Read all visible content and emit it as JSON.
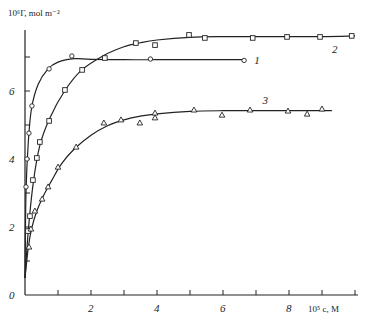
{
  "chart_data": {
    "type": "scatter",
    "title": "",
    "xlabel": "10^5 c, M",
    "ylabel": "10^6 Γ, mol m^-2",
    "xlim": [
      0,
      10.2
    ],
    "ylim": [
      0,
      8.0
    ],
    "x_ticks": [
      1,
      2,
      3,
      4,
      5,
      6,
      7,
      8,
      9,
      10
    ],
    "x_tick_labels": [
      {
        "value": 2,
        "label": "2"
      },
      {
        "value": 4,
        "label": "4"
      },
      {
        "value": 6,
        "label": "6"
      },
      {
        "value": 8,
        "label": "8"
      }
    ],
    "y_ticks": [
      1,
      2,
      3,
      4,
      5,
      6,
      7
    ],
    "y_tick_labels": [
      {
        "value": 0,
        "label": "0"
      },
      {
        "value": 2,
        "label": "2"
      },
      {
        "value": 4,
        "label": "4"
      },
      {
        "value": 6,
        "label": "6"
      }
    ],
    "grid": false,
    "legend": "inline curve labels",
    "series": [
      {
        "name": "1",
        "marker": "circle",
        "points": [
          [
            0.03,
            3.18
          ],
          [
            0.06,
            4.0
          ],
          [
            0.12,
            4.76
          ],
          [
            0.21,
            5.56
          ],
          [
            0.73,
            6.65
          ],
          [
            1.42,
            7.03
          ],
          [
            3.8,
            6.94
          ],
          [
            6.64,
            6.9
          ]
        ],
        "curve": [
          [
            0,
            0.5
          ],
          [
            0.03,
            3.0
          ],
          [
            0.1,
            4.5
          ],
          [
            0.2,
            5.5
          ],
          [
            0.4,
            6.2
          ],
          [
            0.7,
            6.65
          ],
          [
            1.0,
            6.85
          ],
          [
            1.5,
            6.95
          ],
          [
            2.0,
            6.93
          ],
          [
            3.0,
            6.92
          ],
          [
            4.0,
            6.92
          ],
          [
            5.0,
            6.92
          ],
          [
            6.0,
            6.92
          ],
          [
            6.6,
            6.92
          ]
        ],
        "label_pos": [
          6.95,
          6.9
        ]
      },
      {
        "name": "2",
        "marker": "square",
        "points": [
          [
            0.09,
            1.88
          ],
          [
            0.15,
            2.32
          ],
          [
            0.24,
            3.38
          ],
          [
            0.36,
            4.03
          ],
          [
            0.45,
            4.5
          ],
          [
            0.73,
            5.12
          ],
          [
            1.21,
            6.03
          ],
          [
            1.73,
            6.62
          ],
          [
            2.42,
            6.97
          ],
          [
            3.36,
            7.41
          ],
          [
            3.94,
            7.35
          ],
          [
            4.97,
            7.65
          ],
          [
            5.45,
            7.56
          ],
          [
            6.9,
            7.56
          ],
          [
            7.94,
            7.59
          ],
          [
            8.94,
            7.59
          ],
          [
            9.9,
            7.62
          ]
        ],
        "curve": [
          [
            0,
            0.5
          ],
          [
            0.1,
            1.9
          ],
          [
            0.25,
            3.3
          ],
          [
            0.45,
            4.4
          ],
          [
            0.75,
            5.2
          ],
          [
            1.2,
            6.0
          ],
          [
            1.7,
            6.6
          ],
          [
            2.4,
            7.05
          ],
          [
            3.0,
            7.3
          ],
          [
            3.5,
            7.42
          ],
          [
            4.0,
            7.5
          ],
          [
            5.0,
            7.58
          ],
          [
            6.0,
            7.6
          ],
          [
            7.0,
            7.6
          ],
          [
            8.0,
            7.6
          ],
          [
            9.0,
            7.6
          ],
          [
            10.0,
            7.62
          ]
        ],
        "label_pos": [
          9.3,
          7.25
        ]
      },
      {
        "name": "3",
        "marker": "triangle",
        "points": [
          [
            0.12,
            1.41
          ],
          [
            0.18,
            1.94
          ],
          [
            0.3,
            2.47
          ],
          [
            0.52,
            2.82
          ],
          [
            0.7,
            3.18
          ],
          [
            1.0,
            3.76
          ],
          [
            1.55,
            4.35
          ],
          [
            2.39,
            5.06
          ],
          [
            2.91,
            5.15
          ],
          [
            3.48,
            5.06
          ],
          [
            3.94,
            5.21
          ],
          [
            3.94,
            5.35
          ],
          [
            5.12,
            5.44
          ],
          [
            5.97,
            5.29
          ],
          [
            6.82,
            5.44
          ],
          [
            7.97,
            5.41
          ],
          [
            8.55,
            5.32
          ],
          [
            9.0,
            5.47
          ]
        ],
        "curve": [
          [
            0,
            0.5
          ],
          [
            0.1,
            1.4
          ],
          [
            0.2,
            1.95
          ],
          [
            0.35,
            2.45
          ],
          [
            0.55,
            2.9
          ],
          [
            0.8,
            3.35
          ],
          [
            1.1,
            3.85
          ],
          [
            1.5,
            4.3
          ],
          [
            2.0,
            4.7
          ],
          [
            2.5,
            4.98
          ],
          [
            3.0,
            5.15
          ],
          [
            3.5,
            5.26
          ],
          [
            4.0,
            5.33
          ],
          [
            5.0,
            5.4
          ],
          [
            6.0,
            5.42
          ],
          [
            7.0,
            5.42
          ],
          [
            8.0,
            5.42
          ],
          [
            9.0,
            5.42
          ],
          [
            9.3,
            5.42
          ]
        ],
        "label_pos": [
          7.2,
          5.75
        ]
      }
    ]
  },
  "axes": {
    "ylabel_text": "10⁶Γ, mol m⁻²",
    "xlabel_text": "10⁵ c, M"
  }
}
